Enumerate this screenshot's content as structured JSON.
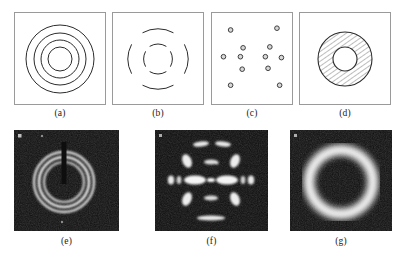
{
  "figure": {
    "type": "scientific-figure",
    "background_color": "#ffffff",
    "line_color": "#2b2b2b",
    "frame_color": "#9a9a9a",
    "photo_background": "#0d0d0d",
    "photo_highlight": "#ffffff",
    "footnote_text": "",
    "panels": [
      {
        "id": "a",
        "label": "(a)",
        "kind": "schematic",
        "content": "concentric-rings",
        "ring_count": 4,
        "ring_radii": [
          43,
          33,
          24,
          15
        ]
      },
      {
        "id": "b",
        "label": "(b)",
        "kind": "schematic",
        "content": "broken-arcs",
        "ring_count": 2,
        "ring_radii": [
          38,
          20
        ],
        "arcs_per_ring": 4
      },
      {
        "id": "c",
        "label": "(c)",
        "kind": "schematic",
        "content": "discrete-spots",
        "spot_count": 12,
        "spot_radius": 2.6,
        "spots": [
          [
            22,
            18
          ],
          [
            74,
            16
          ],
          [
            36,
            38
          ],
          [
            66,
            37
          ],
          [
            14,
            48
          ],
          [
            33,
            48
          ],
          [
            61,
            48
          ],
          [
            79,
            49
          ],
          [
            35,
            62
          ],
          [
            64,
            61
          ],
          [
            22,
            80
          ],
          [
            77,
            80
          ]
        ]
      },
      {
        "id": "d",
        "label": "(d)",
        "kind": "schematic",
        "content": "hatched-annulus",
        "outer_radius": 33,
        "inner_radius": 14,
        "hatch_angle_deg": 55
      },
      {
        "id": "e",
        "label": "(e)",
        "kind": "photograph",
        "content": "debye-scherrer-rings",
        "ring_count": 3,
        "beam_stop": "vertical-shadow-top"
      },
      {
        "id": "f",
        "label": "(f)",
        "kind": "photograph",
        "content": "oriented-fiber-pattern",
        "features": "equatorial-streaks-and-layer-line-arcs"
      },
      {
        "id": "g",
        "label": "(g)",
        "kind": "photograph",
        "content": "amorphous-halo",
        "features": "single-broad-diffuse-ring"
      }
    ]
  }
}
